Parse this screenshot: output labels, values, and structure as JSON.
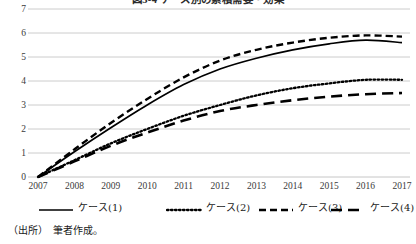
{
  "chart_data": {
    "type": "line",
    "title": "図3-4 ケース別の累積需要・効果",
    "xlabel": "",
    "ylabel": "",
    "x": [
      2007,
      2008,
      2009,
      2010,
      2011,
      2012,
      2013,
      2014,
      2015,
      2016,
      2017
    ],
    "xtick_labels": [
      "2007",
      "2008",
      "2009",
      "2010",
      "2011",
      "2012",
      "2013",
      "2014",
      "2015",
      "2016",
      "2017"
    ],
    "ylim": [
      0,
      7
    ],
    "ytick_labels": [
      "0",
      "1",
      "2",
      "3",
      "4",
      "5",
      "6",
      "7"
    ],
    "yticks": [
      0,
      1,
      2,
      3,
      4,
      5,
      6,
      7
    ],
    "grid": "horizontal",
    "legend_position": "bottom",
    "series": [
      {
        "name": "ケース(1)",
        "style": "solid",
        "values": [
          0.0,
          1.05,
          2.05,
          3.0,
          3.85,
          4.5,
          4.95,
          5.3,
          5.55,
          5.7,
          5.6
        ]
      },
      {
        "name": "ケース(2)",
        "style": "dotted",
        "values": [
          0.0,
          0.7,
          1.4,
          2.0,
          2.55,
          3.0,
          3.4,
          3.7,
          3.9,
          4.05,
          4.05
        ]
      },
      {
        "name": "ケース(3)",
        "style": "dashed",
        "values": [
          0.0,
          1.15,
          2.25,
          3.25,
          4.15,
          4.85,
          5.3,
          5.6,
          5.8,
          5.9,
          5.85
        ]
      },
      {
        "name": "ケース(4)",
        "style": "long-dashed",
        "values": [
          0.0,
          0.65,
          1.3,
          1.85,
          2.35,
          2.75,
          3.0,
          3.2,
          3.35,
          3.45,
          3.5
        ]
      }
    ]
  },
  "source": {
    "note": "（出所）　筆者作成。"
  },
  "colors": {
    "line": "#000000",
    "grid": "#bfbfbf",
    "text": "#1a1a1a"
  }
}
